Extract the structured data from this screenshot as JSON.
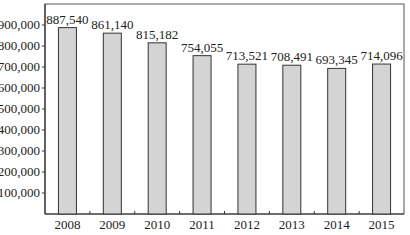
{
  "chart_data": {
    "type": "bar",
    "title": "",
    "xlabel": "",
    "ylabel": "",
    "categories": [
      "2008",
      "2009",
      "2010",
      "2011",
      "2012",
      "2013",
      "2014",
      "2015"
    ],
    "values": [
      887540,
      861140,
      815182,
      754055,
      713521,
      708491,
      693345,
      714096
    ],
    "value_labels": [
      "887,540",
      "861,140",
      "815,182",
      "754,055",
      "713,521",
      "708,491",
      "693,345",
      "714,096"
    ],
    "ylim": [
      0,
      1000000
    ],
    "yticks": [
      100000,
      200000,
      300000,
      400000,
      500000,
      600000,
      700000,
      800000,
      900000
    ],
    "ytick_labels": [
      "100,000",
      "200,000",
      "300,000",
      "400,000",
      "500,000",
      "600,000",
      "700,000",
      "800,000",
      "900,000"
    ],
    "grid": false,
    "legend": null,
    "colors": {
      "bar_fill": "#d4d4d4",
      "bar_stroke": "#333333",
      "axis": "#333333",
      "frame": "#555555"
    }
  }
}
